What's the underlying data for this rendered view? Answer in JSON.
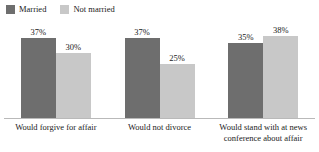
{
  "chart_data": {
    "type": "bar",
    "title": "",
    "subtitle": "",
    "xlabel": "",
    "ylabel": "",
    "ylim": [
      0,
      45
    ],
    "grid": false,
    "legend_position": "top-left",
    "value_suffix": "%",
    "categories": [
      "Would forgive for affair",
      "Would not divorce",
      "Would stand with at news conference about affair"
    ],
    "series": [
      {
        "name": "Married",
        "color": "#6e6e6e",
        "values": [
          37,
          37,
          35
        ],
        "value_labels": [
          "37%",
          "37%",
          "35%"
        ]
      },
      {
        "name": "Not married",
        "color": "#c8c8c8",
        "values": [
          30,
          25,
          38
        ],
        "value_labels": [
          "30%",
          "25%",
          "38%"
        ]
      }
    ]
  },
  "legend": {
    "items": [
      {
        "label": "Married",
        "color": "#6e6e6e"
      },
      {
        "label": "Not married",
        "color": "#c8c8c8"
      }
    ]
  },
  "axis": {
    "baseline_color": "#b9b9b9",
    "category_labels": [
      {
        "lines": [
          "Would forgive for affair"
        ]
      },
      {
        "lines": [
          "Would not divorce"
        ]
      },
      {
        "lines": [
          "Would stand with at news",
          "conference about affair"
        ]
      }
    ]
  }
}
